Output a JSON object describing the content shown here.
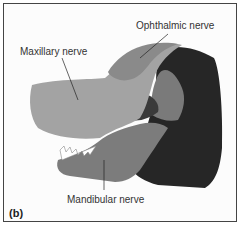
{
  "figure": {
    "panel_label": "(b)",
    "labels": {
      "ophthalmic": "Ophthalmic nerve",
      "maxillary": "Maxillary nerve",
      "mandibular": "Mandibular nerve"
    },
    "colors": {
      "ophthalmic": "#8a8a8a",
      "maxillary": "#a3a3a3",
      "mandibular": "#7c7c7c",
      "neck": "#262626",
      "ear_inner": "#3a3a3a",
      "border": "#444444"
    }
  }
}
